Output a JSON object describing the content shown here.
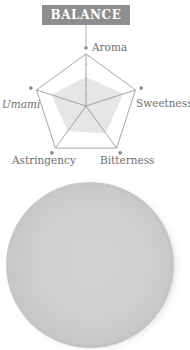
{
  "title": "BALANCE",
  "chart_data": {
    "type": "radar",
    "title": "BALANCE",
    "categories": [
      "Aroma",
      "Sweetness",
      "Bitterness",
      "Astringency",
      "Umami"
    ],
    "values": [
      0.56,
      0.75,
      0.65,
      0.6,
      0.7
    ],
    "range": [
      0,
      1
    ],
    "grid": "single outer pentagon with spokes",
    "fill_color": "#e6e6e6",
    "line_color": "#8a8a8a",
    "label_styles": {
      "Umami": "italic"
    }
  },
  "labels": {
    "aroma": "Aroma",
    "sweetness": "Sweetness",
    "bitterness": "Bitterness",
    "astringency": "Astringency",
    "umami": "Umami"
  },
  "image": {
    "description": "round ceramic plate"
  }
}
